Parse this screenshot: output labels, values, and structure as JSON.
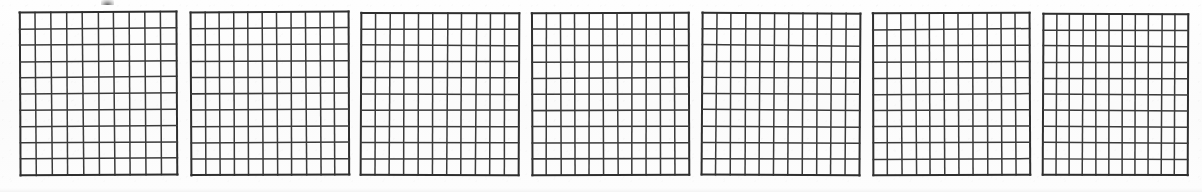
{
  "page": {
    "width": 1202,
    "height": 192,
    "background_color": "#fdfdfd",
    "line_color": "#3b3b3b",
    "border_color": "#2f2f2f",
    "artifacts": {
      "top_smudge_label": "ink-smudge",
      "top_smudge_x": 101,
      "top_smudge_y": 0
    }
  },
  "grids": [
    {
      "label": "grid-1",
      "index": 1,
      "columns": 10,
      "rows": 10,
      "x": 20,
      "y": 12,
      "width": 157,
      "height": 163,
      "rotation": -0.4,
      "stroke_width": 1.5,
      "border_width": 2.0
    },
    {
      "label": "grid-2",
      "index": 2,
      "columns": 11,
      "rows": 10,
      "x": 191,
      "y": 12,
      "width": 158,
      "height": 163,
      "rotation": -0.3,
      "stroke_width": 1.5,
      "border_width": 2.0
    },
    {
      "label": "grid-3",
      "index": 3,
      "columns": 11,
      "rows": 10,
      "x": 361,
      "y": 13,
      "width": 158,
      "height": 162,
      "rotation": 0.25,
      "stroke_width": 1.5,
      "border_width": 2.0
    },
    {
      "label": "grid-4",
      "index": 4,
      "columns": 11,
      "rows": 10,
      "x": 532,
      "y": 13,
      "width": 157,
      "height": 162,
      "rotation": -0.2,
      "stroke_width": 1.5,
      "border_width": 2.0
    },
    {
      "label": "grid-5",
      "index": 5,
      "columns": 11,
      "rows": 10,
      "x": 702,
      "y": 13,
      "width": 158,
      "height": 162,
      "rotation": 0.3,
      "stroke_width": 1.5,
      "border_width": 2.0
    },
    {
      "label": "grid-6",
      "index": 6,
      "columns": 11,
      "rows": 10,
      "x": 873,
      "y": 13,
      "width": 157,
      "height": 162,
      "rotation": -0.25,
      "stroke_width": 1.5,
      "border_width": 2.0
    },
    {
      "label": "grid-7",
      "index": 7,
      "columns": 11,
      "rows": 10,
      "x": 1043,
      "y": 14,
      "width": 145,
      "height": 161,
      "rotation": 0.2,
      "stroke_width": 1.5,
      "border_width": 2.0
    }
  ]
}
